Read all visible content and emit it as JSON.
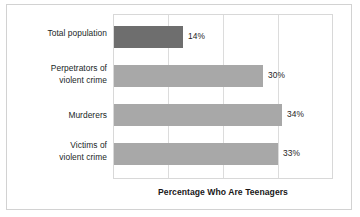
{
  "chart_data": {
    "type": "bar",
    "orientation": "horizontal",
    "title": "",
    "xlabel": "Percentage Who Are Teenagers",
    "ylabel": "",
    "categories": [
      "Total population",
      "Perpetrators of violent crime",
      "Murderers",
      "Victims of violent crime"
    ],
    "category_lines": [
      [
        "Total population"
      ],
      [
        "Perpetrators of",
        "violent crime"
      ],
      [
        "Murderers"
      ],
      [
        "Victims of",
        "violent crime"
      ]
    ],
    "values": [
      14,
      30,
      34,
      33
    ],
    "data_labels": [
      "14%",
      "30%",
      "34%",
      "33%"
    ],
    "xlim": [
      0,
      44
    ],
    "gridlines": [
      0,
      11,
      22,
      33,
      44
    ],
    "grid": true,
    "legend": "none",
    "colors": {
      "accent_bar": "#6e6e6e",
      "normal_bar": "#a8a8a8",
      "gridline": "#dcdcdc",
      "plot_border": "#d8d8d8",
      "frame_border": "#d2d2d2",
      "background": "#ffffff",
      "text": "#211f1f"
    }
  }
}
